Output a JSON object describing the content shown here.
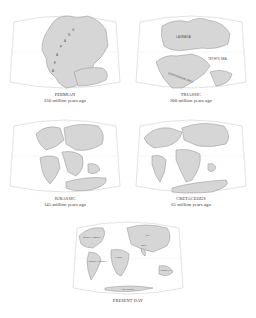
{
  "figure": {
    "panels": [
      {
        "id": "permian",
        "era": "PERMIAN",
        "age": "250 million years ago",
        "labels": [
          "P",
          "A",
          "N",
          "G",
          "A",
          "E",
          "A"
        ]
      },
      {
        "id": "triassic",
        "era": "TRIASSIC",
        "age": "200 million years ago",
        "labels": [
          "LAURASIA",
          "TETHYS SEA",
          "GONDWANALAND"
        ]
      },
      {
        "id": "jurassic",
        "era": "JURASSIC",
        "age": "145 million years ago",
        "labels": []
      },
      {
        "id": "cretaceous",
        "era": "CRETACEOUS",
        "age": "65 million years ago",
        "labels": []
      },
      {
        "id": "present",
        "era": "PRESENT DAY",
        "age": "",
        "labels": [
          "NORTH AMERICA",
          "SOUTH AMERICA",
          "AFRICA",
          "ASIA",
          "INDIA",
          "AUSTRALIA",
          "ANTARCTICA"
        ]
      }
    ]
  },
  "colors": {
    "land_fill": "#d6d6d6",
    "coast_stroke": "#8e8e8e",
    "frame_stroke": "#cfcfcf",
    "text": "#333333"
  }
}
